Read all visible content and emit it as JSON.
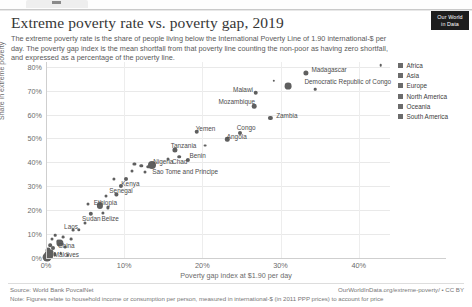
{
  "browser": {
    "tab_label": ""
  },
  "header": {
    "title": "Extreme poverty rate vs. poverty gap, 2019",
    "subtitle": "The extreme poverty rate is the share of people living below the International Poverty Line of 1.90 international-$ per day. The poverty gap index is the mean shortfall from that poverty line counting the non-poor as having zero shortfall, and expressed as a percentage of the poverty line.",
    "logo_line1": "Our World",
    "logo_line2": "in Data"
  },
  "footer": {
    "source": "Source: World Bank PovcalNet",
    "note": "Note: Figures relate to household income or consumption per person, measured in international-$ (in 2011 PPP prices) to account for price",
    "owid_url": "OurWorldInData.org/extreme-poverty/ • CC BY"
  },
  "legend": {
    "items": [
      {
        "label": "Africa",
        "color": "#6b6b6b"
      },
      {
        "label": "Asia",
        "color": "#6b6b6b"
      },
      {
        "label": "Europe",
        "color": "#6b6b6b"
      },
      {
        "label": "North America",
        "color": "#6b6b6b"
      },
      {
        "label": "Oceania",
        "color": "#6b6b6b"
      },
      {
        "label": "South America",
        "color": "#6b6b6b"
      }
    ]
  },
  "chart_data": {
    "type": "scatter",
    "title": "Extreme poverty rate vs. poverty gap, 2019",
    "xlabel": "Poverty gap index at $1.90 per day",
    "ylabel": "Share in extreme poverty",
    "xlim": [
      0,
      44
    ],
    "ylim": [
      0,
      82
    ],
    "xticks": [
      0,
      10,
      20,
      30,
      40
    ],
    "xtick_labels": [
      "0%",
      "10%",
      "20%",
      "30%",
      "40%"
    ],
    "yticks": [
      0,
      10,
      20,
      30,
      40,
      50,
      60,
      70,
      80
    ],
    "ytick_labels": [
      "0%",
      "10%",
      "20%",
      "30%",
      "40%",
      "50%",
      "60%",
      "70%",
      "80%"
    ],
    "grid": true,
    "legend_position": "right",
    "point_color": "#5f5f5f",
    "points": [
      {
        "label": "Madagascar",
        "x": 33.2,
        "y": 77.4,
        "r": 2.6,
        "lx": 36.2,
        "ly": 79.0
      },
      {
        "label": "Democratic Republic of Congo",
        "x": 31.0,
        "y": 72.0,
        "r": 3.4,
        "lx": 38.6,
        "ly": 74.2
      },
      {
        "label": "Malawi",
        "x": 26.8,
        "y": 69.2,
        "r": 2.3,
        "lx": 25.2,
        "ly": 70.6
      },
      {
        "label": "Mozambique",
        "x": 26.6,
        "y": 63.4,
        "r": 2.3,
        "lx": 24.4,
        "ly": 65.5
      },
      {
        "label": "Zambia",
        "x": 28.7,
        "y": 58.6,
        "r": 2.1,
        "lx": 30.8,
        "ly": 60.0
      },
      {
        "label": "Congo",
        "x": 24.8,
        "y": 52.2,
        "r": 2.0,
        "lx": 25.6,
        "ly": 54.6
      },
      {
        "label": "Angola",
        "x": 23.2,
        "y": 49.6,
        "r": 2.2,
        "lx": 24.4,
        "ly": 51.0
      },
      {
        "label": "Yemen",
        "x": 19.3,
        "y": 52.8,
        "r": 2.3,
        "lx": 20.4,
        "ly": 54.5
      },
      {
        "label": "Tanzania",
        "x": 16.5,
        "y": 45.2,
        "r": 2.6,
        "lx": 17.6,
        "ly": 47.2
      },
      {
        "label": "Benin",
        "x": 18.2,
        "y": 41.0,
        "r": 2.1,
        "lx": 19.4,
        "ly": 43.0
      },
      {
        "label": "Chad",
        "x": 17.0,
        "y": 42.4,
        "r": 1.8,
        "lx": 17.1,
        "ly": 40.4
      },
      {
        "label": "Nigeria",
        "x": 13.6,
        "y": 39.0,
        "r": 4.0,
        "lx": 15.0,
        "ly": 40.6
      },
      {
        "label": "Sao Tome and Principe",
        "x": 13.1,
        "y": 38.2,
        "r": 1.7,
        "lx": 17.8,
        "ly": 36.5
      },
      {
        "label": "Kenya",
        "x": 10.2,
        "y": 33.0,
        "r": 2.0,
        "lx": 10.8,
        "ly": 31.4
      },
      {
        "label": "Senegal",
        "x": 9.6,
        "y": 30.0,
        "r": 2.1,
        "lx": 9.6,
        "ly": 28.4
      },
      {
        "label": "Ethiopia",
        "x": 6.9,
        "y": 22.0,
        "r": 3.1,
        "lx": 7.6,
        "ly": 23.6
      },
      {
        "label": "Sudan",
        "x": 5.7,
        "y": 18.6,
        "r": 2.2,
        "lx": 5.8,
        "ly": 16.8
      },
      {
        "label": "Belize",
        "x": 7.3,
        "y": 18.9,
        "r": 1.6,
        "lx": 8.2,
        "ly": 16.8
      },
      {
        "label": "Laos",
        "x": 4.2,
        "y": 11.8,
        "r": 1.7,
        "lx": 3.2,
        "ly": 13.4
      },
      {
        "label": "China",
        "x": 1.8,
        "y": 6.2,
        "r": 3.6,
        "lx": 2.6,
        "ly": 5.6
      },
      {
        "label": "Maldives",
        "x": 1.1,
        "y": 1.6,
        "r": 1.7,
        "lx": 2.6,
        "ly": 1.6
      }
    ],
    "unlabeled_points": [
      {
        "x": 42.8,
        "y": 80.6,
        "r": 1.3
      },
      {
        "x": 34.4,
        "y": 70.6,
        "r": 1.3
      },
      {
        "x": 29.1,
        "y": 74.2,
        "r": 1.2
      },
      {
        "x": 20.4,
        "y": 47.0,
        "r": 1.4
      },
      {
        "x": 15.6,
        "y": 41.4,
        "r": 1.5
      },
      {
        "x": 12.2,
        "y": 38.6,
        "r": 1.7
      },
      {
        "x": 11.3,
        "y": 39.4,
        "r": 1.6
      },
      {
        "x": 12.6,
        "y": 36.0,
        "r": 1.5
      },
      {
        "x": 11.0,
        "y": 36.4,
        "r": 1.5
      },
      {
        "x": 8.7,
        "y": 33.2,
        "r": 1.6
      },
      {
        "x": 9.0,
        "y": 26.6,
        "r": 1.6
      },
      {
        "x": 7.7,
        "y": 26.0,
        "r": 1.5
      },
      {
        "x": 5.4,
        "y": 22.8,
        "r": 1.5
      },
      {
        "x": 7.9,
        "y": 21.2,
        "r": 1.6
      },
      {
        "x": 5.0,
        "y": 14.6,
        "r": 1.5
      },
      {
        "x": 3.5,
        "y": 11.6,
        "r": 1.4
      },
      {
        "x": 3.2,
        "y": 8.0,
        "r": 1.4
      },
      {
        "x": 1.2,
        "y": 9.6,
        "r": 1.3
      },
      {
        "x": 2.2,
        "y": 8.8,
        "r": 1.4
      },
      {
        "x": 0.8,
        "y": 7.8,
        "r": 1.5
      },
      {
        "x": 1.5,
        "y": 7.0,
        "r": 1.6
      },
      {
        "x": 0.5,
        "y": 5.4,
        "r": 1.8
      },
      {
        "x": 2.4,
        "y": 4.4,
        "r": 1.4
      },
      {
        "x": 0.9,
        "y": 4.0,
        "r": 2.0
      },
      {
        "x": 0.3,
        "y": 3.4,
        "r": 2.4
      },
      {
        "x": 0.6,
        "y": 2.6,
        "r": 2.6
      },
      {
        "x": 0.2,
        "y": 1.8,
        "r": 3.2
      },
      {
        "x": 0.4,
        "y": 0.9,
        "r": 3.8
      },
      {
        "x": 0.15,
        "y": 0.5,
        "r": 4.4
      },
      {
        "x": 0.1,
        "y": 0.2,
        "r": 3.0
      },
      {
        "x": 1.9,
        "y": 2.0,
        "r": 1.3
      },
      {
        "x": 2.8,
        "y": 1.2,
        "r": 1.3
      }
    ]
  }
}
